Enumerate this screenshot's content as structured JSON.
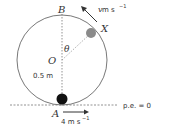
{
  "diagram": {
    "circle": {
      "cx": 62,
      "cy": 60,
      "r": 45,
      "stroke": "#555555"
    },
    "points": {
      "B": {
        "label": "B",
        "x": 62,
        "y": 15
      },
      "O": {
        "label": "O",
        "x": 62,
        "y": 60
      },
      "A": {
        "label": "A",
        "x": 62,
        "y": 105
      },
      "X": {
        "label": "X",
        "x": 91,
        "y": 33
      }
    },
    "theta_label": "θ",
    "radius_label": "0.5 m",
    "ball_A": {
      "color": "#111111"
    },
    "ball_X": {
      "color": "#8a8a8a"
    },
    "velocity_top": {
      "label_v": "v",
      "label_unit": " m s",
      "exponent": "−1"
    },
    "velocity_bottom": {
      "label": "4 m s",
      "exponent": "−1"
    },
    "reference_line": {
      "label": "p.e. = 0"
    }
  }
}
